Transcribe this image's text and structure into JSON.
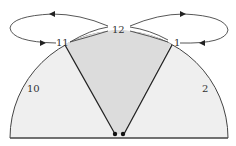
{
  "diagram": {
    "labels": {
      "twelve": "12",
      "eleven": "11",
      "one": "1",
      "ten": "10",
      "two": "2"
    },
    "colors": {
      "stroke": "#3a3a3a",
      "fill_region": "#eeeeee",
      "fill_triangle": "#dedede",
      "background": "#ffffff"
    }
  }
}
